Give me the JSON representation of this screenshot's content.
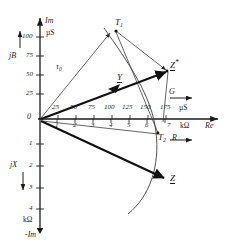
{
  "diagram": {
    "axes": {
      "imag_top": "Im",
      "imag_bottom": "-Im",
      "real": "Re",
      "susceptance": "jB",
      "reactance": "jX",
      "conductance": "G",
      "resistance": "R",
      "unit_siemens": "µS",
      "unit_ohm": "kΩ"
    },
    "axis_arrows": {
      "jb_arrow": "↑",
      "jx_arrow": "↓",
      "g_arrow": "→",
      "r_arrow": "→"
    },
    "ticks": {
      "imag_up": [
        "100",
        "75",
        "50",
        "25"
      ],
      "imag_up_values": [
        100,
        75,
        50,
        25
      ],
      "imag_down": [
        "1",
        "2",
        "3",
        "4"
      ],
      "imag_down_values": [
        1,
        2,
        3,
        4
      ],
      "origin": "0",
      "conductance": [
        "25",
        "50",
        "75",
        "100",
        "125",
        "150",
        "175"
      ],
      "conductance_values": [
        25,
        50,
        75,
        100,
        125,
        150,
        175
      ],
      "resistance": [
        "1",
        "2",
        "3",
        "4",
        "5",
        "6",
        "7"
      ],
      "resistance_values": [
        1,
        2,
        3,
        4,
        5,
        6,
        7
      ]
    },
    "points": {
      "t1": "T",
      "t1_sub": "1",
      "t2": "T",
      "t2_sub": "2",
      "z_conj": "Z",
      "z_conj_sup": "*",
      "z": "Z",
      "y": "Y",
      "tau0": "τ",
      "tau0_sub": "0"
    },
    "colors": {
      "line": "#1a1a1a",
      "thin": "#3c3c3c",
      "background": "#ffffff"
    }
  }
}
